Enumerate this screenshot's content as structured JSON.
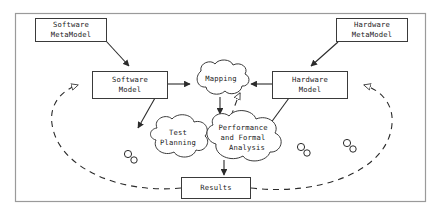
{
  "diagram": {
    "frame": {
      "name": "outer-frame",
      "x": 15,
      "y": 13,
      "width": 411,
      "height": 189,
      "stroke": "#9a9a9a"
    },
    "colors": {
      "background": "#ffffff",
      "node_stroke": "#3a3a3a",
      "edge_stroke": "#2b2b2b",
      "frame_stroke": "#9a9a9a",
      "text": "#1a1a1a"
    },
    "nodes": [
      {
        "id": "software-metamodel",
        "shape": "box",
        "label_lines": [
          "Software",
          "MetaModel"
        ],
        "x": 35,
        "y": 18,
        "width": 72,
        "height": 23
      },
      {
        "id": "hardware-metamodel",
        "shape": "box",
        "label_lines": [
          "Hardware",
          "MetaModel"
        ],
        "x": 336,
        "y": 18,
        "width": 72,
        "height": 23
      },
      {
        "id": "software-model",
        "shape": "box",
        "label_lines": [
          "Software",
          "Model"
        ],
        "x": 92,
        "y": 71,
        "width": 76,
        "height": 27
      },
      {
        "id": "hardware-model",
        "shape": "box",
        "label_lines": [
          "Hardware",
          "Model"
        ],
        "x": 272,
        "y": 71,
        "width": 76,
        "height": 27
      },
      {
        "id": "mapping",
        "shape": "cloud",
        "label_lines": [
          "Mapping"
        ],
        "x": 191,
        "y": 63,
        "width": 58,
        "height": 34
      },
      {
        "id": "test-planning",
        "shape": "cloud",
        "label_lines": [
          "Test",
          "Planning"
        ],
        "x": 148,
        "y": 119,
        "width": 62,
        "height": 38
      },
      {
        "id": "performance-and-formal-analysis",
        "shape": "cloud",
        "label_lines": [
          "Performance",
          "and Formal",
          "Analysis"
        ],
        "x": 204,
        "y": 116,
        "width": 82,
        "height": 44
      },
      {
        "id": "results",
        "shape": "box",
        "label_lines": [
          "Results"
        ],
        "x": 181,
        "y": 177,
        "width": 70,
        "height": 21
      }
    ],
    "edges": [
      {
        "id": "swmm-to-swm",
        "from": "software-metamodel",
        "to": "software-model",
        "style": "solid",
        "arrow": "filled"
      },
      {
        "id": "hwmm-to-hwm",
        "from": "hardware-metamodel",
        "to": "hardware-model",
        "style": "solid",
        "arrow": "filled"
      },
      {
        "id": "swm-to-mapping",
        "from": "software-model",
        "to": "mapping",
        "style": "solid",
        "arrow": "filled"
      },
      {
        "id": "hwm-to-mapping",
        "from": "hardware-model",
        "to": "mapping",
        "style": "solid",
        "arrow": "filled"
      },
      {
        "id": "mapping-to-analysis",
        "from": "mapping",
        "to": "performance-and-formal-analysis",
        "style": "solid",
        "arrow": "filled"
      },
      {
        "id": "swm-to-testplanning",
        "from": "software-model",
        "to": "test-planning",
        "style": "solid",
        "arrow": "filled"
      },
      {
        "id": "hwm-to-analysis",
        "from": "hardware-model",
        "to": "performance-and-formal-analysis",
        "style": "solid",
        "arrow": "filled"
      },
      {
        "id": "analysis-to-results",
        "from": "performance-and-formal-analysis",
        "to": "results",
        "style": "solid",
        "arrow": "filled"
      },
      {
        "id": "results-feedback-to-software-model",
        "from": "results",
        "to": "software-model",
        "style": "dashed",
        "arrow": "hollow"
      },
      {
        "id": "results-feedback-to-hardware-model",
        "from": "results",
        "to": "hardware-model",
        "style": "dashed",
        "arrow": "hollow"
      },
      {
        "id": "mapping-feedback-left",
        "from": "results",
        "to": "mapping",
        "style": "dashed",
        "arrow": "hollow"
      }
    ],
    "decorations": [
      {
        "id": "gear-pair-left",
        "type": "gear-pair",
        "x": 130,
        "y": 157
      },
      {
        "id": "gear-pair-middle",
        "type": "gear-pair",
        "x": 304,
        "y": 150
      },
      {
        "id": "gear-pair-right",
        "type": "gear-pair",
        "x": 350,
        "y": 146
      }
    ]
  }
}
